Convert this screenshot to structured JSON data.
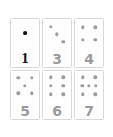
{
  "page": {
    "background_color": "#ffffff"
  },
  "card_style": {
    "face_color": "#fefefe",
    "border_color": "#d8d8d8",
    "pip_color": "#9d9d9d",
    "numeral_color": "#9a9a9a",
    "highlight_pip_color": "#111111",
    "highlight_numeral_color": "#111111"
  },
  "grid": {
    "columns": 3,
    "rows": 2,
    "cards": [
      {
        "id": "card-1",
        "numeral": "1",
        "pip_count": 1,
        "highlighted": true,
        "pips": [
          [
            50,
            42
          ]
        ]
      },
      {
        "id": "card-3",
        "numeral": "3",
        "pip_count": 3,
        "highlighted": false,
        "pips": [
          [
            28,
            20
          ],
          [
            50,
            47
          ],
          [
            72,
            74
          ]
        ]
      },
      {
        "id": "card-4",
        "numeral": "4",
        "pip_count": 4,
        "highlighted": false,
        "pips": [
          [
            28,
            22
          ],
          [
            72,
            22
          ],
          [
            28,
            68
          ],
          [
            72,
            68
          ]
        ]
      },
      {
        "id": "card-5",
        "numeral": "5",
        "pip_count": 5,
        "highlighted": false,
        "pips": [
          [
            26,
            18
          ],
          [
            74,
            18
          ],
          [
            50,
            45
          ],
          [
            26,
            72
          ],
          [
            74,
            72
          ]
        ]
      },
      {
        "id": "card-6",
        "numeral": "6",
        "pip_count": 6,
        "highlighted": false,
        "pips": [
          [
            28,
            16
          ],
          [
            72,
            16
          ],
          [
            28,
            46
          ],
          [
            72,
            46
          ],
          [
            28,
            76
          ],
          [
            72,
            76
          ]
        ]
      },
      {
        "id": "card-7",
        "numeral": "7",
        "pip_count": 7,
        "highlighted": false,
        "pips": [
          [
            28,
            16
          ],
          [
            72,
            16
          ],
          [
            26,
            46
          ],
          [
            50,
            46
          ],
          [
            74,
            46
          ],
          [
            28,
            76
          ],
          [
            72,
            76
          ]
        ]
      }
    ]
  }
}
